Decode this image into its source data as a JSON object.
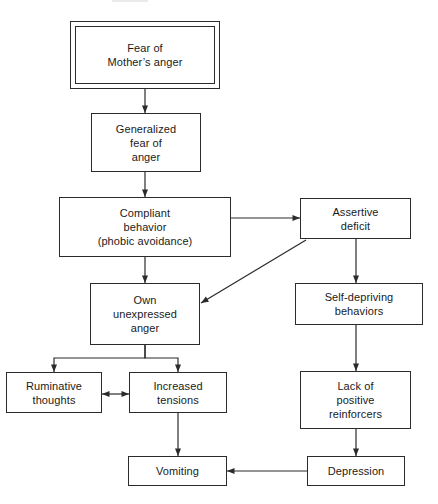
{
  "diagram": {
    "width": 438,
    "height": 504,
    "stroke_color": "#2b2b2b",
    "background_color": "#ffffff",
    "text_color": "#1a1a1a"
  },
  "nodes": [
    {
      "id": "fear-of-mothers-anger",
      "label": "Fear of\nMother’s anger",
      "x": 70,
      "y": 21,
      "w": 150,
      "h": 68,
      "double_border": true
    },
    {
      "id": "generalized-fear-of-anger",
      "label": "Generalized\nfear of\nanger",
      "x": 91,
      "y": 113,
      "w": 110,
      "h": 59,
      "double_border": false
    },
    {
      "id": "compliant-behavior",
      "label": "Compliant\nbehavior\n(phobic avoidance)",
      "x": 59,
      "y": 197,
      "w": 172,
      "h": 60,
      "double_border": false
    },
    {
      "id": "assertive-deficit",
      "label": "Assertive\ndeficit",
      "x": 300,
      "y": 198,
      "w": 111,
      "h": 41,
      "double_border": false
    },
    {
      "id": "own-unexpressed-anger",
      "label": "Own\nunexpressed\nanger",
      "x": 90,
      "y": 283,
      "w": 110,
      "h": 62,
      "double_border": false
    },
    {
      "id": "self-depriving-behaviors",
      "label": "Self-depriving\nbehaviors",
      "x": 295,
      "y": 283,
      "w": 128,
      "h": 42,
      "double_border": false
    },
    {
      "id": "ruminative-thoughts",
      "label": "Ruminative\nthoughts",
      "x": 6,
      "y": 372,
      "w": 96,
      "h": 41,
      "double_border": false
    },
    {
      "id": "increased-tensions",
      "label": "Increased\ntensions",
      "x": 129,
      "y": 372,
      "w": 98,
      "h": 41,
      "double_border": false
    },
    {
      "id": "lack-of-positive-reinforcers",
      "label": "Lack of\npositive\nreinforcers",
      "x": 300,
      "y": 371,
      "w": 111,
      "h": 58,
      "double_border": false
    },
    {
      "id": "vomiting",
      "label": "Vomiting",
      "x": 128,
      "y": 456,
      "w": 99,
      "h": 30,
      "double_border": false
    },
    {
      "id": "depression",
      "label": "Depression",
      "x": 307,
      "y": 456,
      "w": 98,
      "h": 30,
      "double_border": false
    }
  ],
  "edges": [
    {
      "id": "edge-fear-to-generalized",
      "from": "fear-of-mothers-anger",
      "to": "generalized-fear-of-anger",
      "kind": "vertical-arrow",
      "points": "145,89 145,113",
      "arrow_end": true,
      "arrow_start": false
    },
    {
      "id": "edge-generalized-to-compliant",
      "from": "generalized-fear-of-anger",
      "to": "compliant-behavior",
      "kind": "vertical-arrow",
      "points": "145,172 145,197",
      "arrow_end": true,
      "arrow_start": false
    },
    {
      "id": "edge-compliant-to-assertive",
      "from": "compliant-behavior",
      "to": "assertive-deficit",
      "kind": "horizontal-arrow",
      "points": "231,218 300,218",
      "arrow_end": true,
      "arrow_start": false
    },
    {
      "id": "edge-compliant-to-own-anger",
      "from": "compliant-behavior",
      "to": "own-unexpressed-anger",
      "kind": "vertical-arrow",
      "points": "145,257 145,283",
      "arrow_end": true,
      "arrow_start": false
    },
    {
      "id": "edge-assertive-to-own-anger",
      "from": "assertive-deficit",
      "to": "own-unexpressed-anger",
      "kind": "diagonal-arrow",
      "points": "306,240 201,303",
      "arrow_end": true,
      "arrow_start": false
    },
    {
      "id": "edge-assertive-to-self-depriving",
      "from": "assertive-deficit",
      "to": "self-depriving-behaviors",
      "kind": "vertical-arrow",
      "points": "356,239 356,283",
      "arrow_end": true,
      "arrow_start": false
    },
    {
      "id": "edge-own-anger-to-ruminative",
      "from": "own-unexpressed-anger",
      "to": "ruminative-thoughts",
      "kind": "branch-arrow",
      "points": "145,345 145,358 54,358 54,372",
      "arrow_end": true,
      "arrow_start": false
    },
    {
      "id": "edge-own-anger-to-increased-tensions",
      "from": "own-unexpressed-anger",
      "to": "increased-tensions",
      "kind": "branch-arrow",
      "points": "145,345 145,358 178,358 178,372",
      "arrow_end": true,
      "arrow_start": false
    },
    {
      "id": "edge-ruminative-increased-bidirectional",
      "from": "ruminative-thoughts",
      "to": "increased-tensions",
      "kind": "bidirectional-arrow",
      "points": "102,394 129,394",
      "arrow_end": true,
      "arrow_start": true
    },
    {
      "id": "edge-self-depriving-to-lack",
      "from": "self-depriving-behaviors",
      "to": "lack-of-positive-reinforcers",
      "kind": "vertical-arrow",
      "points": "356,325 356,371",
      "arrow_end": true,
      "arrow_start": false
    },
    {
      "id": "edge-increased-tensions-to-vomiting",
      "from": "increased-tensions",
      "to": "vomiting",
      "kind": "vertical-arrow",
      "points": "178,413 178,456",
      "arrow_end": true,
      "arrow_start": false
    },
    {
      "id": "edge-lack-to-depression",
      "from": "lack-of-positive-reinforcers",
      "to": "depression",
      "kind": "vertical-arrow",
      "points": "356,429 356,456",
      "arrow_end": true,
      "arrow_start": false
    },
    {
      "id": "edge-depression-to-vomiting",
      "from": "depression",
      "to": "vomiting",
      "kind": "horizontal-arrow",
      "points": "307,471 227,471",
      "arrow_end": true,
      "arrow_start": false
    }
  ]
}
